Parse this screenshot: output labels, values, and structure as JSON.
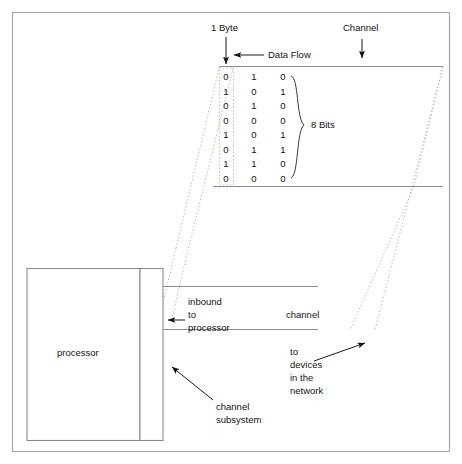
{
  "figure": {
    "background": "#ffffff",
    "line_color": "#8c8c8c",
    "dotted_color": "#b9b9b9",
    "text_color": "#141414"
  },
  "labels": {
    "one_byte": "1 Byte",
    "data_flow": "Data Flow",
    "channel_top": "Channel",
    "eight_bits": "8 Bits",
    "processor": "processor",
    "channel_mid": "channel",
    "inbound_line1": "inbound",
    "inbound_line2": "to",
    "inbound_line3": "processor",
    "devices_line1": "to",
    "devices_line2": "devices",
    "devices_line3": "in the",
    "devices_line4": "network",
    "subsystem_line1": "channel",
    "subsystem_line2": "subsystem"
  },
  "byte_matrix": {
    "rows": 8,
    "columns": 3,
    "values": [
      [
        "0",
        "1",
        "0"
      ],
      [
        "1",
        "0",
        "1"
      ],
      [
        "0",
        "1",
        "0"
      ],
      [
        "0",
        "0",
        "0"
      ],
      [
        "1",
        "0",
        "1"
      ],
      [
        "0",
        "1",
        "1"
      ],
      [
        "1",
        "1",
        "0"
      ],
      [
        "0",
        "0",
        "0"
      ]
    ]
  }
}
